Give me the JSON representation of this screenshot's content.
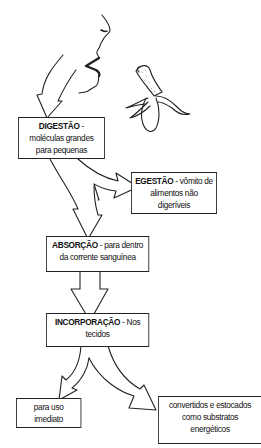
{
  "diagram": {
    "type": "flowchart",
    "title": "",
    "illustrations": [
      "face-profile-eating",
      "peeled-banana"
    ],
    "nodes": [
      {
        "id": "digestao",
        "term": "DIGESTÃO",
        "desc": " - moléculas grandes para pequenas"
      },
      {
        "id": "egestao",
        "term": "EGESTÃO",
        "desc": " - vômito de alimentos não digeríveis"
      },
      {
        "id": "absorcao",
        "term": "ABSORÇÃO",
        "desc": " - para dentro da corrente sanguínea"
      },
      {
        "id": "incorporacao",
        "term": "INCORPORAÇÃO",
        "desc": " - Nos tecidos"
      },
      {
        "id": "uso",
        "term": "",
        "desc": "para uso imediato"
      },
      {
        "id": "convertidos",
        "term": "",
        "desc": "convertidos e estocados como substratos energéticos"
      }
    ],
    "edges": [
      {
        "from": "mouth",
        "to": "digestao"
      },
      {
        "from": "digestao",
        "to": "egestao"
      },
      {
        "from": "digestao",
        "to": "absorcao"
      },
      {
        "from": "absorcao",
        "to": "incorporacao"
      },
      {
        "from": "incorporacao",
        "to": "uso"
      },
      {
        "from": "incorporacao",
        "to": "convertidos"
      }
    ],
    "line_color": "#222222",
    "background": "#ffffff"
  }
}
